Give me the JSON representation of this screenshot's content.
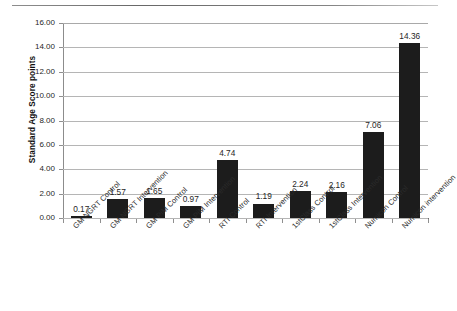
{
  "chart_data": {
    "type": "bar",
    "title": "",
    "subtitle": "",
    "xlabel": "",
    "ylabel": "Standard Age Score points",
    "ylim": [
      0,
      16
    ],
    "ytick_step": 2,
    "ytick_labels": [
      "0.00",
      "2.00",
      "4.00",
      "6.00",
      "8.00",
      "10.00",
      "12.00",
      "14.00",
      "16.00"
    ],
    "grid": true,
    "legend": "none",
    "bar_color": "#1c1c1c",
    "gridline_color": "#b5b5b5",
    "background_color": "#ffffff",
    "categories": [
      "GM NGRT Control",
      "GM NGRT Intervention",
      "GM PiM Control",
      "GM PiM Intervention",
      "RTI Control",
      "RTI Intervention",
      "1stClass Control",
      "1stClass Intervention",
      "Numicon Control",
      "Numicon intervention"
    ],
    "values": [
      0.17,
      1.57,
      1.65,
      0.97,
      4.74,
      1.19,
      2.24,
      2.16,
      7.06,
      14.36
    ],
    "data_labels": [
      "0.17",
      "1.57",
      "1.65",
      "0.97",
      "4.74",
      "1.19",
      "2.24",
      "2.16",
      "7.06",
      "14.36"
    ]
  }
}
